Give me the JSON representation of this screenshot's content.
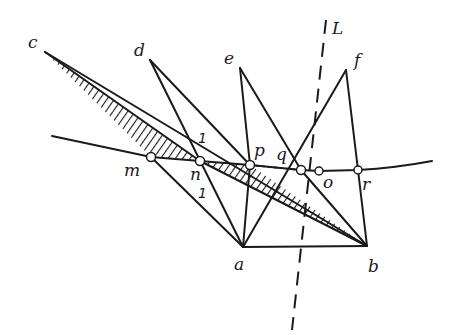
{
  "diagram": {
    "type": "geometric construction",
    "points": {
      "c": {
        "label": "c"
      },
      "d": {
        "label": "d"
      },
      "e": {
        "label": "e"
      },
      "f": {
        "label": "f"
      },
      "a": {
        "label": "a"
      },
      "b": {
        "label": "b"
      },
      "m": {
        "label": "m"
      },
      "n": {
        "label": "n"
      },
      "p": {
        "label": "p"
      },
      "q": {
        "label": "q"
      },
      "o": {
        "label": "o"
      },
      "r": {
        "label": "r"
      }
    },
    "axis_line": {
      "label": "L",
      "style": "dashed"
    },
    "curve": {
      "passes_through": [
        "m",
        "n",
        "p",
        "q",
        "o",
        "r"
      ]
    },
    "marks": [
      {
        "label": "1",
        "position": "above n"
      },
      {
        "label": "1",
        "position": "below n"
      }
    ],
    "segments": [
      [
        "c",
        "n"
      ],
      [
        "c",
        "b"
      ],
      [
        "m",
        "a"
      ],
      [
        "d",
        "a"
      ],
      [
        "d",
        "q"
      ],
      [
        "e",
        "p"
      ],
      [
        "e",
        "o"
      ],
      [
        "f",
        "a"
      ],
      [
        "f",
        "r"
      ],
      [
        "a",
        "b"
      ],
      [
        "n",
        "b"
      ],
      [
        "r",
        "b"
      ],
      [
        "p",
        "a"
      ]
    ],
    "hatched_regions": [
      {
        "vertices": [
          "c",
          "m",
          "n"
        ]
      },
      {
        "vertices": [
          "n",
          "b",
          "p"
        ]
      }
    ]
  }
}
